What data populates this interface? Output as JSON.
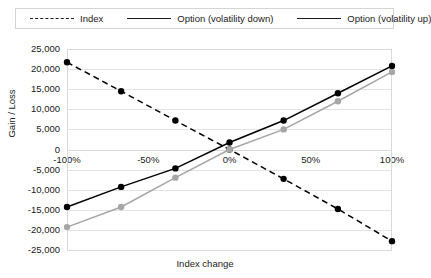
{
  "chart_data": {
    "type": "line",
    "title": "",
    "xlabel": "Index change",
    "ylabel": "Gain / Loss",
    "x": [
      -100,
      -66.7,
      -33.3,
      0,
      33.3,
      66.7,
      100
    ],
    "xtick_labels": [
      "-100%",
      "-50%",
      "0%",
      "50%",
      "100%"
    ],
    "xtick_values": [
      -100,
      -50,
      0,
      50,
      100
    ],
    "xlim": [
      -100,
      100
    ],
    "ytick_labels": [
      "25,000",
      "20,000",
      "15,000",
      "10,000",
      "5,000",
      "0",
      "-5,000",
      "-10,000",
      "-15,000",
      "-20,000",
      "-25,000"
    ],
    "ytick_values": [
      25000,
      20000,
      15000,
      10000,
      5000,
      0,
      -5000,
      -10000,
      -15000,
      -20000,
      -25000
    ],
    "ylim": [
      -25000,
      25000
    ],
    "grid": true,
    "legend_position": "top",
    "series": [
      {
        "name": "Index",
        "color": "#000000",
        "style": "dashed",
        "marker": "circle",
        "values": [
          21700,
          14500,
          7200,
          0,
          -7300,
          -14800,
          -22800
        ]
      },
      {
        "name": "Option (volatility down)",
        "color": "#a6a6a6",
        "style": "solid",
        "marker": "circle",
        "values": [
          -19300,
          -14300,
          -7000,
          0,
          5000,
          12000,
          19300
        ]
      },
      {
        "name": "Option (volatility up)",
        "color": "#000000",
        "style": "solid",
        "marker": "circle",
        "values": [
          -14300,
          -9300,
          -4700,
          1750,
          7200,
          14000,
          20800
        ]
      }
    ]
  },
  "legend": {
    "items": [
      {
        "label": "Index"
      },
      {
        "label": "Option (volatility down)"
      },
      {
        "label": "Option (volatility up)"
      }
    ]
  }
}
